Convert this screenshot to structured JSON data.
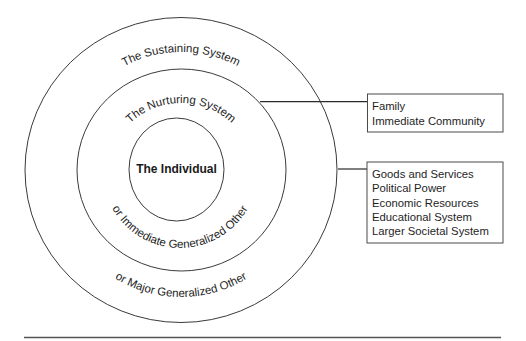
{
  "diagram": {
    "rings": {
      "outer": {
        "top_label": "The Sustaining System",
        "bottom_label": "or Major Generalized Other"
      },
      "middle": {
        "top_label": "The Nurturing System",
        "bottom_label": "or Immediate Generalized Other"
      },
      "inner": {
        "label": "The Individual"
      }
    },
    "boxes": {
      "nurturing": {
        "items": [
          "Family",
          "Immediate Community"
        ]
      },
      "sustaining": {
        "items": [
          "Goods and Services",
          "Political Power",
          "Economic Resources",
          "Educational System",
          "Larger Societal System"
        ]
      }
    },
    "colors": {
      "stroke": "#3a3a3a",
      "text": "#1e1e1e",
      "background": "#ffffff"
    }
  }
}
